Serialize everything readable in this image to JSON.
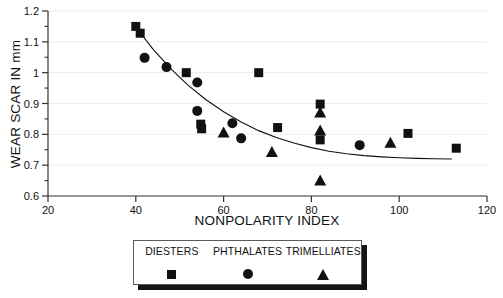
{
  "chart_data": {
    "type": "scatter",
    "title": "",
    "xlabel": "NONPOLARITY INDEX",
    "ylabel": "WEAR SCAR IN mm",
    "xlim": [
      20,
      120
    ],
    "ylim": [
      0.6,
      1.2
    ],
    "xticks": [
      20,
      40,
      60,
      80,
      100,
      120
    ],
    "xtick_labels": [
      "20",
      "40",
      "60",
      "80",
      "100",
      "120"
    ],
    "yticks": [
      0.6,
      0.7,
      0.8,
      0.9,
      1.0,
      1.1,
      1.2
    ],
    "ytick_labels": [
      "0.6",
      "0.7",
      "0.8",
      "0.9",
      "1",
      "1.1",
      "1.2"
    ],
    "minor_ytick_step": 0.05,
    "grid": "horizontal-faint",
    "legend_position": "below-axes",
    "series": [
      {
        "name": "DIESTERS",
        "marker": "square",
        "color": "#111111",
        "points": [
          [
            40.0,
            1.15
          ],
          [
            41.0,
            1.128
          ],
          [
            51.5,
            1.0
          ],
          [
            54.8,
            0.833
          ],
          [
            55.0,
            0.818
          ],
          [
            68.0,
            1.0
          ],
          [
            72.3,
            0.822
          ],
          [
            82.0,
            0.898
          ],
          [
            82.0,
            0.782
          ],
          [
            102.0,
            0.803
          ],
          [
            113.0,
            0.755
          ]
        ]
      },
      {
        "name": "PHTHALATES",
        "marker": "circle",
        "color": "#111111",
        "points": [
          [
            42.0,
            1.048
          ],
          [
            47.0,
            1.018
          ],
          [
            54.0,
            0.968
          ],
          [
            54.0,
            0.876
          ],
          [
            62.0,
            0.836
          ],
          [
            64.0,
            0.787
          ],
          [
            91.0,
            0.765
          ]
        ]
      },
      {
        "name": "TRIMELLIATES",
        "marker": "triangle",
        "color": "#111111",
        "points": [
          [
            60.0,
            0.803
          ],
          [
            71.0,
            0.74
          ],
          [
            82.0,
            0.868
          ],
          [
            82.0,
            0.81
          ],
          [
            82.0,
            0.648
          ],
          [
            98.0,
            0.77
          ]
        ]
      }
    ],
    "fit_curve": {
      "name": "trend-line",
      "color": "#111111",
      "x": [
        40,
        44,
        48,
        52,
        56,
        60,
        64,
        68,
        72,
        76,
        80,
        84,
        88,
        92,
        96,
        100,
        104,
        108,
        112
      ],
      "y": [
        1.148,
        1.075,
        1.012,
        0.958,
        0.912,
        0.873,
        0.84,
        0.812,
        0.79,
        0.772,
        0.757,
        0.745,
        0.737,
        0.731,
        0.727,
        0.724,
        0.722,
        0.721,
        0.72
      ]
    }
  },
  "legend": {
    "entries": [
      {
        "label": "DIESTERS",
        "marker": "square"
      },
      {
        "label": "PHTHALATES",
        "marker": "circle"
      },
      {
        "label": "TRIMELLIATES",
        "marker": "triangle"
      }
    ]
  }
}
